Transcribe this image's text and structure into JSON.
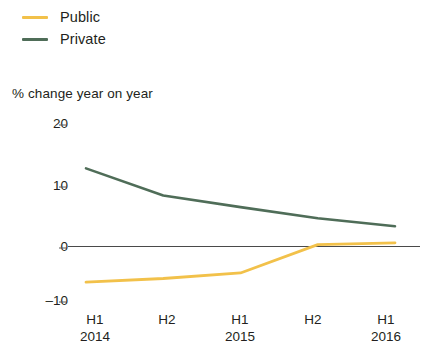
{
  "legend": {
    "position": "top-left",
    "items": [
      {
        "label": "Public",
        "color": "#f2c14a",
        "key": "public"
      },
      {
        "label": "Private",
        "color": "#4f6d58",
        "key": "private"
      }
    ]
  },
  "axis_caption": "% change year on year",
  "chart_data": {
    "type": "line",
    "title": "",
    "subtitle": "",
    "xlabel": "",
    "ylabel": "% change year on year",
    "ylim": [
      -10,
      20
    ],
    "yticks": [
      20,
      10,
      0,
      -10
    ],
    "ytick_labels": [
      "20",
      "10",
      "0",
      "–10"
    ],
    "grid": false,
    "zero_line": true,
    "legend_position": "top-left",
    "x": [
      "H1 2014",
      "H2 2014",
      "H1 2015",
      "H2 2015",
      "H1 2016"
    ],
    "xtick_labels": [
      {
        "half": "H1",
        "year": "2014"
      },
      {
        "half": "H2",
        "year": ""
      },
      {
        "half": "H1",
        "year": "2015"
      },
      {
        "half": "H2",
        "year": ""
      },
      {
        "half": "H1",
        "year": "2016"
      }
    ],
    "series": [
      {
        "name": "Public",
        "color": "#f2c14a",
        "values": [
          -5.8,
          -5.2,
          -4.3,
          0.3,
          0.6
        ]
      },
      {
        "name": "Private",
        "color": "#4f6d58",
        "values": [
          12.7,
          8.3,
          6.4,
          4.6,
          3.3
        ]
      }
    ]
  }
}
